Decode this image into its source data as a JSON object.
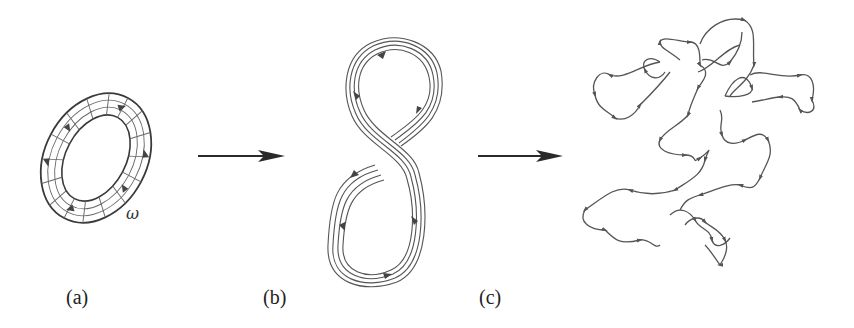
{
  "figure": {
    "panels": [
      {
        "id": "a",
        "label": "(a)",
        "description": "Vortex tube (torus) with vorticity field lines",
        "symbol": "ω"
      },
      {
        "id": "b",
        "label": "(b)",
        "description": "Stretched and folded vortex tube forming figure-eight"
      },
      {
        "id": "c",
        "label": "(c)",
        "description": "Highly convoluted, tangled vortex filaments"
      }
    ],
    "arrows": [
      {
        "from": "a",
        "to": "b"
      },
      {
        "from": "b",
        "to": "c"
      }
    ],
    "colors": {
      "line": "#555555",
      "arrow": "#2a2a2a",
      "background": "#ffffff"
    }
  }
}
